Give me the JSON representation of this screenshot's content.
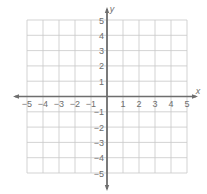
{
  "chart_data": {
    "type": "scatter",
    "title": "",
    "xlabel": "x",
    "ylabel": "y",
    "xlim": [
      -5,
      5
    ],
    "ylim": [
      -5,
      5
    ],
    "grid": true,
    "x_ticks": [
      -5,
      -4,
      -3,
      -2,
      -1,
      1,
      2,
      3,
      4,
      5
    ],
    "y_ticks": [
      5,
      4,
      3,
      2,
      1,
      -1,
      -2,
      -3,
      -4,
      -5
    ],
    "x_tick_labels": [
      "−5",
      "−4",
      "−3",
      "−2",
      "−1",
      "1",
      "2",
      "3",
      "4",
      "5"
    ],
    "y_tick_labels": [
      "5",
      "4",
      "3",
      "2",
      "1",
      "−1",
      "−2",
      "−3",
      "−4",
      "−5"
    ],
    "points": [],
    "legend": null
  },
  "colors": {
    "grid": "#c8c8c8",
    "axis": "#6e6e6e",
    "label": "#6e6e6e",
    "background": "#ffffff"
  },
  "layout": {
    "left": 27,
    "right": 187,
    "top": 20,
    "bottom": 173,
    "origin_x": 107,
    "origin_y": 97
  }
}
